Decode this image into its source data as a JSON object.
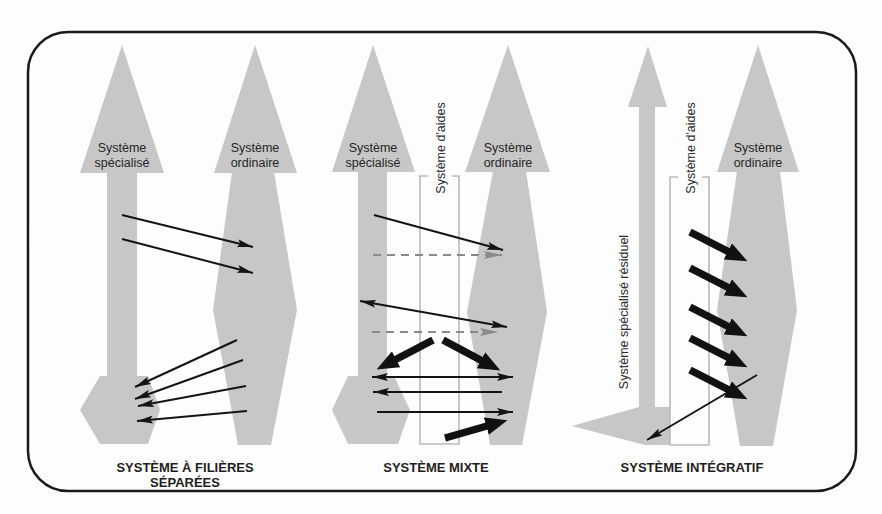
{
  "colors": {
    "system_fill": "#c7c7c7",
    "frame_stroke": "#1a1a1a",
    "arrow": "#141414",
    "dashed_arrow": "#8a8a8a",
    "aids_box_stroke": "#b9b9b9"
  },
  "panels": [
    {
      "id": "separate",
      "title_line1": "SYSTÈME À FILIÈRES",
      "title_line2": "SÉPARÉES",
      "specialized_label_line1": "Système",
      "specialized_label_line2": "spécialisé",
      "ordinary_label_line1": "Système",
      "ordinary_label_line2": "ordinaire",
      "arrows": {
        "to_ordinary_thin": 2,
        "to_specialized_thin": 4
      }
    },
    {
      "id": "mixed",
      "title": "SYSTÈME MIXTE",
      "specialized_label_line1": "Système",
      "specialized_label_line2": "spécialisé",
      "ordinary_label_line1": "Système",
      "ordinary_label_line2": "ordinaire",
      "aids_label": "Système d'aides",
      "arrows": {
        "thin_to_ordinary": 2,
        "dashed_to_ordinary": 2,
        "double_headed": 2,
        "thin_to_specialized": 1,
        "thick": 3
      }
    },
    {
      "id": "integrative",
      "title": "SYSTÈME INTÉGRATIF",
      "residual_label": "Système spécialisé résiduel",
      "aids_label": "Système d'aides",
      "ordinary_label_line1": "Système",
      "ordinary_label_line2": "ordinaire",
      "arrows": {
        "thick_to_ordinary": 5,
        "thin_to_residual": 1
      }
    }
  ]
}
